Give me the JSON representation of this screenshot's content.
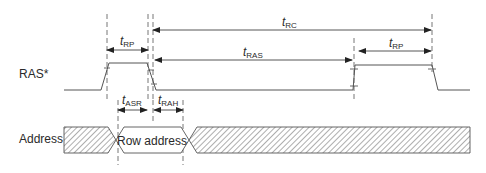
{
  "diagram": {
    "signals": [
      {
        "name": "RAS*"
      },
      {
        "name": "Address"
      }
    ],
    "bus_label": "Row address",
    "timings": {
      "trc": {
        "base": "t",
        "sub": "RC"
      },
      "trp_left": {
        "base": "t",
        "sub": "RP"
      },
      "tras": {
        "base": "t",
        "sub": "RAS"
      },
      "trp_right": {
        "base": "t",
        "sub": "RP"
      },
      "tasr": {
        "base": "t",
        "sub": "ASR"
      },
      "trah": {
        "base": "t",
        "sub": "RAH"
      }
    },
    "colors": {
      "line": "#5a5a5a",
      "text": "#2a2a2a",
      "hatch": "#6a6a6a"
    }
  }
}
